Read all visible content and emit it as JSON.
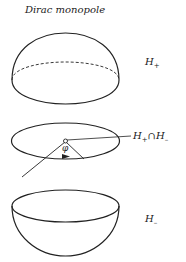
{
  "title": "Dirac monopole",
  "labels": {
    "upper": {
      "main": "H",
      "sub": "+"
    },
    "intersection": {
      "left_main": "H",
      "left_sub": "+",
      "cap": "∩",
      "right_main": "H",
      "right_sub": "–"
    },
    "lower": {
      "main": "H",
      "sub": "–"
    },
    "angle": "φ"
  },
  "colors": {
    "stroke": "#222222",
    "background": "#ffffff"
  }
}
